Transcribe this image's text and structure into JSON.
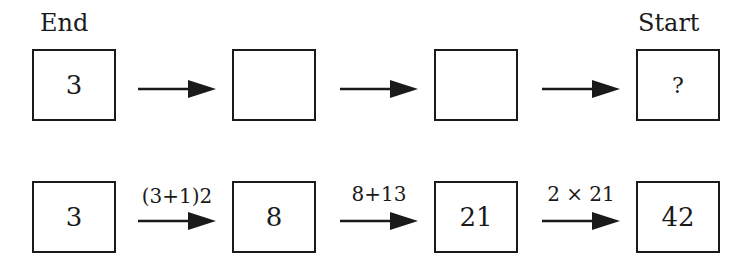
{
  "row1": {
    "end_label": "End",
    "start_label": "Start",
    "boxes": [
      "3",
      "",
      "",
      "?"
    ]
  },
  "row2": {
    "boxes": [
      "3",
      "8",
      "21",
      "42"
    ],
    "operations": [
      "(3+1)2",
      "8+13",
      "2 × 21"
    ]
  },
  "colors": {
    "ink": "#1a1a1a",
    "background": "#ffffff"
  }
}
